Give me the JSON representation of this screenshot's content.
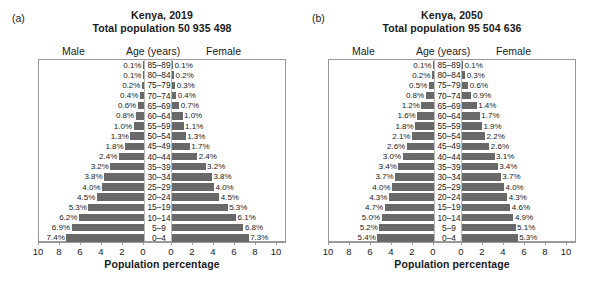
{
  "figure": {
    "panels": [
      {
        "letter": "(a)",
        "title_line1": "Kenya, 2019",
        "title_line2": "Total population 50 935 498",
        "header_male": "Male",
        "header_age": "Age (years)",
        "header_female": "Female"
      },
      {
        "letter": "(b)",
        "title_line1": "Kenya, 2050",
        "title_line2": "Total population 95 504 636",
        "header_male": "Male",
        "header_age": "Age (years)",
        "header_female": "Female"
      }
    ],
    "xlabel": "Population percentage",
    "tick_labels": [
      "10",
      "8",
      "6",
      "4",
      "2",
      "0",
      "0",
      "2",
      "4",
      "6",
      "8",
      "10"
    ],
    "bar_color": "#696969",
    "axis_color": "#9a9a9a"
  },
  "chart_data": [
    {
      "type": "bar",
      "title": "Kenya, 2019",
      "subtitle": "Total population 50 935 498",
      "panel": "(a)",
      "orientation": "population-pyramid",
      "xlabel": "Population percentage",
      "ylabel": "Age (years)",
      "xlim": [
        0,
        10
      ],
      "grid": false,
      "categories": [
        "85–89",
        "80–84",
        "75–79",
        "70–74",
        "65–69",
        "60–64",
        "55–59",
        "50–54",
        "45–49",
        "40–44",
        "35–39",
        "30–34",
        "25–29",
        "20–24",
        "15–19",
        "10–14",
        "5–9",
        "0–4"
      ],
      "series": [
        {
          "name": "Male",
          "side": "left",
          "values": [
            0.1,
            0.1,
            0.2,
            0.4,
            0.6,
            0.8,
            1.0,
            1.3,
            1.8,
            2.4,
            3.2,
            3.8,
            4.0,
            4.5,
            5.3,
            6.2,
            6.9,
            7.4
          ],
          "labels": [
            "0.1%",
            "0.1%",
            "0.2%",
            "0.4%",
            "0.6%",
            "0.8%",
            "1.0%",
            "1.3%",
            "1.8%",
            "2.4%",
            "3.2%",
            "3.8%",
            "4.0%",
            "4.5%",
            "5.3%",
            "6.2%",
            "6.9%",
            "7.4%"
          ]
        },
        {
          "name": "Female",
          "side": "right",
          "values": [
            0.1,
            0.2,
            0.3,
            0.4,
            0.7,
            1.0,
            1.1,
            1.3,
            1.7,
            2.4,
            3.2,
            3.8,
            4.0,
            4.5,
            5.3,
            6.1,
            6.8,
            7.3
          ],
          "labels": [
            "0.1%",
            "0.2%",
            "0.3%",
            "0.4%",
            "0.7%",
            "1.0%",
            "1.1%",
            "1.3%",
            "1.7%",
            "2.4%",
            "3.2%",
            "3.8%",
            "4.0%",
            "4.5%",
            "5.3%",
            "6.1%",
            "6.8%",
            "7.3%"
          ]
        }
      ]
    },
    {
      "type": "bar",
      "title": "Kenya, 2050",
      "subtitle": "Total population 95 504 636",
      "panel": "(b)",
      "orientation": "population-pyramid",
      "xlabel": "Population percentage",
      "ylabel": "Age (years)",
      "xlim": [
        0,
        10
      ],
      "grid": false,
      "categories": [
        "85–89",
        "80–84",
        "75–79",
        "70–74",
        "65–69",
        "60–64",
        "55–59",
        "50–54",
        "45–49",
        "40–44",
        "35–39",
        "30–34",
        "25–29",
        "20–24",
        "15–19",
        "10–14",
        "5–9",
        "0–4"
      ],
      "series": [
        {
          "name": "Male",
          "side": "left",
          "values": [
            0.1,
            0.2,
            0.5,
            0.8,
            1.2,
            1.6,
            1.8,
            2.1,
            2.6,
            3.0,
            3.4,
            3.7,
            4.0,
            4.3,
            4.7,
            5.0,
            5.2,
            5.4
          ],
          "labels": [
            "0.1%",
            "0.2%",
            "0.5%",
            "0.8%",
            "1.2%",
            "1.6%",
            "1.8%",
            "2.1%",
            "2.6%",
            "3.0%",
            "3.4%",
            "3.7%",
            "4.0%",
            "4.3%",
            "4.7%",
            "5.0%",
            "5.2%",
            "5.4%"
          ]
        },
        {
          "name": "Female",
          "side": "right",
          "values": [
            0.1,
            0.3,
            0.6,
            0.9,
            1.4,
            1.7,
            1.9,
            2.2,
            2.6,
            3.1,
            3.4,
            3.7,
            4.0,
            4.3,
            4.6,
            4.9,
            5.1,
            5.3
          ],
          "labels": [
            "0.1%",
            "0.3%",
            "0.6%",
            "0.9%",
            "1.4%",
            "1.7%",
            "1.9%",
            "2.2%",
            "2.6%",
            "3.1%",
            "3.4%",
            "3.7%",
            "4.0%",
            "4.3%",
            "4.6%",
            "4.9%",
            "5.1%",
            "5.3%"
          ]
        }
      ]
    }
  ]
}
